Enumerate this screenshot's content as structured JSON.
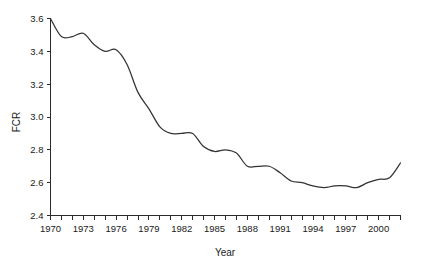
{
  "chart_data": {
    "type": "line",
    "title": "",
    "xlabel": "Year",
    "ylabel": "FCR",
    "xlim": [
      1970,
      2002
    ],
    "ylim": [
      2.4,
      3.6
    ],
    "grid": false,
    "legend": null,
    "x_tick_labels": [
      "1970",
      "1973",
      "1976",
      "1979",
      "1982",
      "1985",
      "1988",
      "1991",
      "1994",
      "1997",
      "2000"
    ],
    "x_tick_values": [
      1970,
      1973,
      1976,
      1979,
      1982,
      1985,
      1988,
      1991,
      1994,
      1997,
      2000
    ],
    "x_minor_tick_values": [
      1970,
      1971,
      1972,
      1973,
      1974,
      1975,
      1976,
      1977,
      1978,
      1979,
      1980,
      1981,
      1982,
      1983,
      1984,
      1985,
      1986,
      1987,
      1988,
      1989,
      1990,
      1991,
      1992,
      1993,
      1994,
      1995,
      1996,
      1997,
      1998,
      1999,
      2000,
      2001,
      2002
    ],
    "y_tick_labels": [
      "2.4",
      "2.6",
      "2.8",
      "3.0",
      "3.2",
      "3.4",
      "3.6"
    ],
    "y_tick_values": [
      2.4,
      2.6,
      2.8,
      3.0,
      3.2,
      3.4,
      3.6
    ],
    "series": [
      {
        "name": "FCR",
        "color": "#333333",
        "x": [
          1970,
          1971,
          1972,
          1973,
          1974,
          1975,
          1976,
          1977,
          1978,
          1979,
          1980,
          1981,
          1982,
          1983,
          1984,
          1985,
          1986,
          1987,
          1988,
          1989,
          1990,
          1991,
          1992,
          1993,
          1994,
          1995,
          1996,
          1997,
          1998,
          1999,
          2000,
          2001,
          2002
        ],
        "values": [
          3.6,
          3.49,
          3.49,
          3.51,
          3.44,
          3.4,
          3.41,
          3.32,
          3.15,
          3.05,
          2.94,
          2.9,
          2.9,
          2.9,
          2.82,
          2.79,
          2.8,
          2.78,
          2.7,
          2.7,
          2.7,
          2.66,
          2.61,
          2.6,
          2.58,
          2.57,
          2.58,
          2.58,
          2.57,
          2.6,
          2.62,
          2.63,
          2.72
        ]
      }
    ]
  }
}
